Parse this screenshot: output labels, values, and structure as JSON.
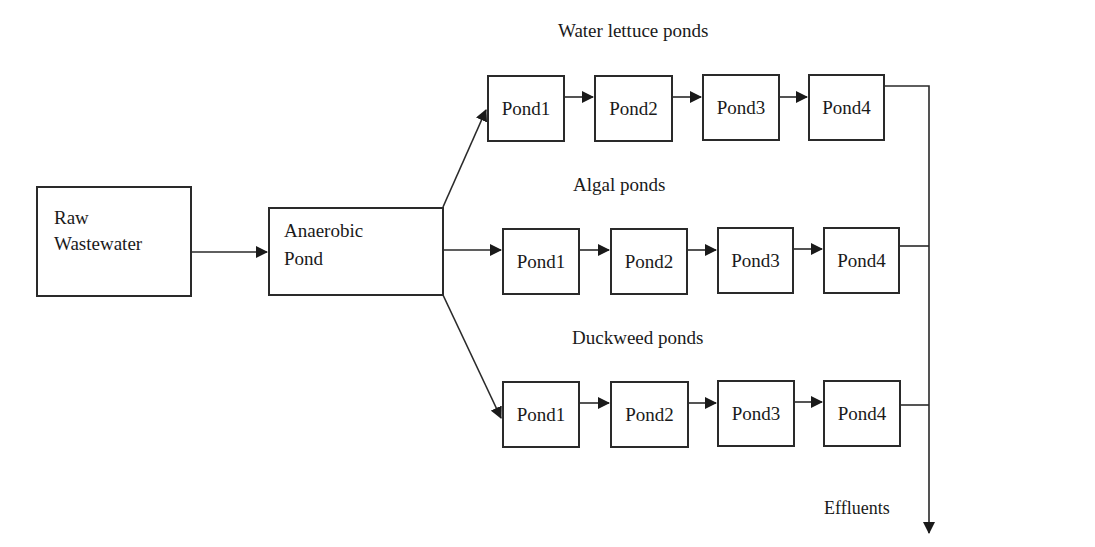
{
  "source": {
    "line1": "Raw",
    "line2": "Wastewater"
  },
  "anaerobic": {
    "line1": "Anaerobic",
    "line2": "Pond"
  },
  "series": [
    {
      "title": "Water lettuce ponds",
      "ponds": [
        "Pond1",
        "Pond2",
        "Pond3",
        "Pond4"
      ]
    },
    {
      "title": "Algal ponds",
      "ponds": [
        "Pond1",
        "Pond2",
        "Pond3",
        "Pond4"
      ]
    },
    {
      "title": "Duckweed ponds",
      "ponds": [
        "Pond1",
        "Pond2",
        "Pond3",
        "Pond4"
      ]
    }
  ],
  "output": {
    "label": "Effluents"
  },
  "colors": {
    "line": "#2a2a2a",
    "background": "#ffffff"
  }
}
